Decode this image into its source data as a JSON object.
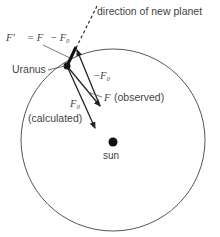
{
  "diagram": {
    "labels": {
      "direction": "direction of new planet",
      "fprime_eq_lhs": "F'",
      "fprime_eq_mid": "= F",
      "fprime_eq_rhs": "− F₀",
      "uranus": "Uranus",
      "neg_f0": "−F₀",
      "f_observed_sym": "F",
      "f_observed_text": "(observed)",
      "f0_sym": "F₀",
      "f0_text": "(calculated)",
      "sun": "sun"
    },
    "colors": {
      "line": "#222222",
      "orbit": "#555555",
      "text": "#444444"
    },
    "nodes": [
      {
        "id": "uranus",
        "x": 67,
        "y": 66
      },
      {
        "id": "sun",
        "x": 113,
        "y": 142
      }
    ],
    "edges": [
      {
        "id": "F-prime",
        "from": "uranus",
        "to": [
          76,
          48
        ],
        "style": "thick"
      },
      {
        "id": "neg-F0",
        "from": [
          100,
          106
        ],
        "to": [
          76,
          48
        ],
        "style": "arrow"
      },
      {
        "id": "F-observed",
        "from": "uranus",
        "to": [
          100,
          106
        ],
        "style": "arrow"
      },
      {
        "id": "F0-calculated",
        "from": "uranus",
        "to": [
          95,
          128
        ],
        "style": "arrow"
      },
      {
        "id": "direction-new-planet",
        "from": [
          76,
          48
        ],
        "to": [
          98,
          4
        ],
        "style": "dashed"
      }
    ]
  }
}
